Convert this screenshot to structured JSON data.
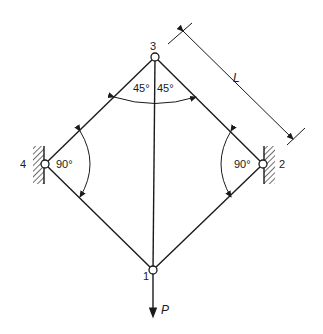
{
  "diagram": {
    "type": "truss",
    "nodes": [
      {
        "id": "1",
        "label": "1",
        "x": 153,
        "y": 270
      },
      {
        "id": "2",
        "label": "2",
        "x": 263,
        "y": 164
      },
      {
        "id": "3",
        "label": "3",
        "x": 155,
        "y": 57
      },
      {
        "id": "4",
        "label": "4",
        "x": 45,
        "y": 164
      }
    ],
    "members": [
      {
        "from": "3",
        "to": "4"
      },
      {
        "from": "3",
        "to": "2"
      },
      {
        "from": "4",
        "to": "1"
      },
      {
        "from": "2",
        "to": "1"
      },
      {
        "from": "3",
        "to": "1"
      }
    ],
    "supports": [
      {
        "node": "4",
        "type": "fixed-wall",
        "side": "left"
      },
      {
        "node": "2",
        "type": "fixed-wall",
        "side": "right"
      }
    ],
    "angles": {
      "node3_left": "45°",
      "node3_right": "45°",
      "node4": "90°",
      "node2": "90°"
    },
    "dimension": {
      "label": "L",
      "measures": "member 3-2 length"
    },
    "load": {
      "label": "P",
      "node": "1",
      "direction": "down"
    }
  }
}
